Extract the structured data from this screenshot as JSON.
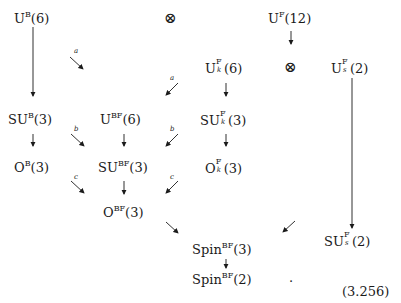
{
  "diagram": {
    "type": "group-chain-diagram",
    "nodes": {
      "UB6": {
        "base": "U",
        "sup": "B",
        "arg": "(6)"
      },
      "UF12": {
        "base": "U",
        "sup": "F",
        "arg": "(12)"
      },
      "UFk6": {
        "base": "U",
        "sup": "F",
        "sub": "k",
        "arg": "(6)"
      },
      "UFs2": {
        "base": "U",
        "sup": "F",
        "sub": "s",
        "arg": "(2)"
      },
      "SUB3": {
        "base": "SU",
        "sup": "B",
        "arg": "(3)"
      },
      "UBF6": {
        "base": "U",
        "sup": "BF",
        "arg": "(6)"
      },
      "SUFk3": {
        "base": "SU",
        "sup": "F",
        "sub": "k",
        "arg": "(3)"
      },
      "OB3": {
        "base": "O",
        "sup": "B",
        "arg": "(3)"
      },
      "SUBF3": {
        "base": "SU",
        "sup": "BF",
        "arg": "(3)"
      },
      "OFk3": {
        "base": "O",
        "sup": "F",
        "sub": "k",
        "arg": "(3)"
      },
      "OBF3": {
        "base": "O",
        "sup": "BF",
        "arg": "(3)"
      },
      "SUFs2": {
        "base": "SU",
        "sup": "F",
        "sub": "s",
        "arg": "(2)"
      },
      "SpinBF3": {
        "base": "Spin",
        "sup": "BF",
        "arg": "(3)"
      },
      "SpinBF2": {
        "base": "Spin",
        "sup": "BF",
        "arg": "(2)"
      }
    },
    "operators": {
      "tensor1": "⊗",
      "tensor2": "⊗"
    },
    "arrow_labels": {
      "a": "a",
      "b": "b",
      "c": "c"
    },
    "edges": [
      {
        "from": "UB6",
        "to": "SUB3"
      },
      {
        "from": "UB6",
        "to": "UBF6",
        "label": "a"
      },
      {
        "from": "UFk6",
        "to": "UBF6",
        "label": "a"
      },
      {
        "from": "UF12",
        "to": "UFk6"
      },
      {
        "from": "UF12",
        "to": "UFs2"
      },
      {
        "from": "UFk6",
        "to": "SUFk3"
      },
      {
        "from": "UFs2",
        "to": "SUFs2"
      },
      {
        "from": "SUB3",
        "to": "OB3"
      },
      {
        "from": "SUB3",
        "to": "SUBF3",
        "label": "b"
      },
      {
        "from": "UBF6",
        "to": "SUBF3"
      },
      {
        "from": "SUFk3",
        "to": "SUBF3",
        "label": "b"
      },
      {
        "from": "SUFk3",
        "to": "OFk3"
      },
      {
        "from": "OB3",
        "to": "OBF3",
        "label": "c"
      },
      {
        "from": "SUBF3",
        "to": "OBF3"
      },
      {
        "from": "OFk3",
        "to": "OBF3",
        "label": "c"
      },
      {
        "from": "OBF3",
        "to": "SpinBF3"
      },
      {
        "from": "SUFs2",
        "to": "SpinBF3"
      },
      {
        "from": "SpinBF3",
        "to": "SpinBF2"
      }
    ],
    "trailing_punctuation": ".",
    "equation_number": "(3.256)"
  }
}
